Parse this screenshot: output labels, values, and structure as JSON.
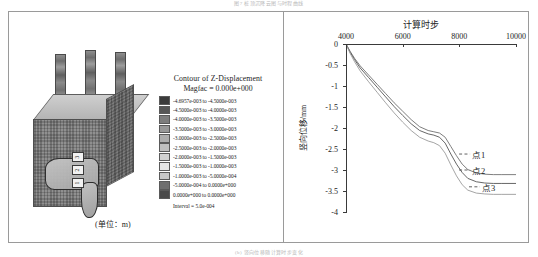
{
  "captions": {
    "top": "图7  桩顶沉降云图与时程曲线",
    "bottom": "(b) 竖向位移随计算时步变化"
  },
  "left_panel": {
    "model_name": "3D FLAC mesh block with three piles",
    "unit_label": "(单位：m)",
    "pile_marks": [
      "3",
      "2",
      "1"
    ],
    "legend": {
      "title": "Contour of Z-Displacement",
      "subtitle": "Magfac =  0.000e+000",
      "interval": "Interval =  5.0e-004",
      "entries": [
        {
          "color": "#3b3b3b",
          "label": "-4.6957e-003 to -4.5000e-003"
        },
        {
          "color": "#565656",
          "label": "-4.5000e-003 to -4.0000e-003"
        },
        {
          "color": "#7d7d7d",
          "label": "-4.0000e-003 to -3.5000e-003"
        },
        {
          "color": "#989898",
          "label": "-3.5000e-003 to -3.0000e-003"
        },
        {
          "color": "#adadad",
          "label": "-3.0000e-003 to -2.5000e-003"
        },
        {
          "color": "#bfbfbf",
          "label": "-2.5000e-003 to -2.0000e-003"
        },
        {
          "color": "#d2d2d2",
          "label": "-2.0000e-003 to -1.5000e-003"
        },
        {
          "color": "#e6e6e6",
          "label": "-1.5000e-003 to -1.0000e-003"
        },
        {
          "color": "#c8c8c8",
          "label": "-1.0000e-003 to -5.0000e-004"
        },
        {
          "color": "#6f6f6f",
          "label": "-5.0000e-004 to  0.0000e+000"
        },
        {
          "color": "#4a4a4a",
          "label": " 0.0000e+000 to  0.0000e+000"
        }
      ]
    }
  },
  "chart_data": {
    "type": "line",
    "title": "计算时步",
    "xlabel": "计算时步",
    "ylabel": "竖向位移/mm",
    "xlim": [
      4000,
      10000
    ],
    "ylim": [
      -4,
      0
    ],
    "xticks": [
      4000,
      6000,
      8000,
      10000
    ],
    "xtick_labels": [
      "4000",
      "6000",
      "8000",
      "10000"
    ],
    "yticks": [
      0,
      -0.5,
      -1,
      -1.5,
      -2,
      -2.5,
      -3,
      -3.5,
      -4
    ],
    "ytick_labels": [
      "0",
      "-0.5",
      "-1",
      "-1.5",
      "-2",
      "-2.5",
      "-3",
      "-3.5",
      "-4"
    ],
    "grid": false,
    "legend_position": "inline-annotations",
    "x": [
      4000,
      4150,
      4300,
      4500,
      4800,
      5100,
      5400,
      5700,
      6000,
      6300,
      6600,
      6900,
      7100,
      7300,
      7500,
      7700,
      7900,
      8100,
      8300,
      8600,
      8900,
      9200,
      9500,
      10000
    ],
    "series": [
      {
        "name": "点1",
        "color": "#6f6f6f",
        "values": [
          0,
          -0.18,
          -0.34,
          -0.52,
          -0.74,
          -0.96,
          -1.18,
          -1.4,
          -1.6,
          -1.8,
          -1.97,
          -2.06,
          -2.09,
          -2.12,
          -2.22,
          -2.44,
          -2.66,
          -2.86,
          -2.99,
          -3.07,
          -3.1,
          -3.11,
          -3.11,
          -3.11
        ],
        "final_value": -3.11
      },
      {
        "name": "点2",
        "color": "#565656",
        "values": [
          0,
          -0.2,
          -0.37,
          -0.57,
          -0.8,
          -1.03,
          -1.26,
          -1.49,
          -1.7,
          -1.9,
          -2.06,
          -2.14,
          -2.17,
          -2.22,
          -2.36,
          -2.62,
          -2.86,
          -3.06,
          -3.2,
          -3.28,
          -3.31,
          -3.32,
          -3.32,
          -3.32
        ],
        "final_value": -3.32
      },
      {
        "name": "点3",
        "color": "#9a9a9a",
        "values": [
          0,
          -0.23,
          -0.42,
          -0.64,
          -0.9,
          -1.15,
          -1.4,
          -1.64,
          -1.86,
          -2.06,
          -2.22,
          -2.31,
          -2.35,
          -2.42,
          -2.6,
          -2.88,
          -3.14,
          -3.35,
          -3.48,
          -3.55,
          -3.57,
          -3.58,
          -3.58,
          -3.58
        ],
        "final_value": -3.58
      }
    ],
    "annotations": [
      {
        "text": "点1",
        "x": 8450,
        "y": -2.62
      },
      {
        "text": "点2",
        "x": 8450,
        "y": -3.0
      },
      {
        "text": "点3",
        "x": 8800,
        "y": -3.4
      }
    ]
  }
}
